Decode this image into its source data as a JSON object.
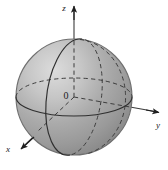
{
  "figure": {
    "kind": "3d-sphere-with-cartesian-axes",
    "width": 170,
    "height": 170,
    "background_color": "#ffffff"
  },
  "labels": {
    "z_axis": "z",
    "y_axis": "y",
    "x_axis": "x",
    "origin": "0"
  },
  "colors": {
    "sphere_light": "#d2d2d2",
    "sphere_mid": "#a8a8a8",
    "sphere_dark": "#8c8c8c",
    "sphere_edge": "#6e6e6e",
    "line": "#2b2b2b",
    "dashed_line": "#3a3a3a",
    "label": "#1a1a1a"
  },
  "geometry": {
    "sphere_center_x": 74,
    "sphere_center_y": 97,
    "sphere_radius": 58,
    "z_arrow_tip_x": 74,
    "z_arrow_tip_y": 3,
    "y_arrow_tip_x": 162,
    "y_arrow_tip_y": 113,
    "x_arrow_tip_x": 19,
    "x_arrow_tip_y": 151
  },
  "elements": {
    "equator_front": "solid-ellipse-arc",
    "equator_back": "dashed-ellipse-arc",
    "meridian_front": "solid-ellipse",
    "meridian_back": "dashed-ellipse-arc",
    "axis_interior": "dashed-segments"
  }
}
